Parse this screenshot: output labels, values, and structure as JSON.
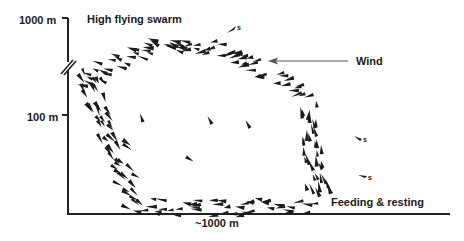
{
  "diagram": {
    "y_axis": {
      "top_label": "1000 m",
      "mid_label": "100 m",
      "break_marker": "axis-break"
    },
    "x_axis": {
      "label": "~1000 m"
    },
    "annotations": {
      "high_swarm": "High flying swarm",
      "wind": "Wind",
      "feeding": "Feeding & resting",
      "straggler_s1": "s",
      "straggler_s2": "s",
      "straggler_s3": "s"
    },
    "colors": {
      "ink": "#1a1a1a",
      "background": "#ffffff",
      "arrow": "#555555"
    }
  }
}
